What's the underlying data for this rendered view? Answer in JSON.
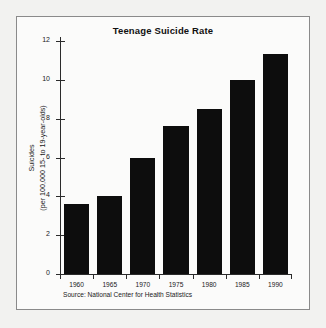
{
  "figure": {
    "frame_color": "#8a8a8a",
    "background": "#fbfbfa",
    "page_background": "#f2f2f0",
    "source_note": "Source: National Center for Health Statistics"
  },
  "axis_label": {
    "line1": "Suicides",
    "line2": "(per 100,000 15- to 19-year-olds)"
  },
  "chart_data": {
    "type": "bar",
    "title": "Teenage Suicide Rate",
    "xlabel": "",
    "ylabel": "Suicides (per 100,000 15- to 19-year-olds)",
    "categories": [
      "1960",
      "1965",
      "1970",
      "1975",
      "1980",
      "1985",
      "1990"
    ],
    "values": [
      3.6,
      4.0,
      5.95,
      7.6,
      8.5,
      10.0,
      11.35
    ],
    "ylim": [
      0,
      12
    ],
    "yticks": [
      0,
      2,
      4,
      6,
      8,
      10,
      12
    ],
    "ytick_labels": [
      "0",
      "2",
      "4",
      "6",
      "8",
      "10",
      "12"
    ],
    "grid": false,
    "legend": false,
    "bar_color": "#0d0d0d",
    "source": "Source: National Center for Health Statistics"
  }
}
